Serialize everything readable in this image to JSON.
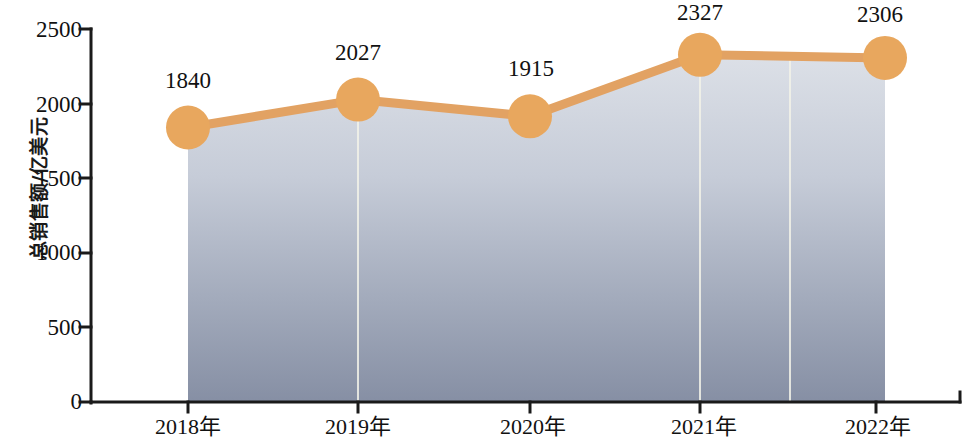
{
  "chart_data": {
    "type": "area",
    "title": "",
    "subtitle": "",
    "xlabel": "",
    "ylabel": "总销售额/亿美元",
    "categories": [
      "2018年",
      "2019年",
      "2020年",
      "2021年",
      "2022年"
    ],
    "values": [
      1840,
      2027,
      1915,
      2327,
      2306
    ],
    "data_labels": [
      "1840",
      "2027",
      "1915",
      "2327",
      "2306"
    ],
    "yticks": [
      "0",
      "500",
      "1000",
      "1500",
      "2000",
      "2500"
    ],
    "ytick_values": [
      0,
      500,
      1000,
      1500,
      2000,
      2500
    ],
    "ylim": [
      0,
      2500
    ],
    "grid": false,
    "legend": "none",
    "series": [
      {
        "name": "总销售额",
        "values": [
          1840,
          2027,
          1915,
          2327,
          2306
        ]
      }
    ],
    "colors": {
      "marker": "#E8A75E",
      "line": "#E2A263",
      "area_top": "#D9DDE5",
      "area_bottom": "#8892A6",
      "axis": "#1a1a1a",
      "text": "#111111",
      "gridline": "#F2F2E8"
    }
  },
  "axis": {
    "y_title": "总销售额/亿美元",
    "y_ticks": [
      "0",
      "500",
      "1000",
      "1500",
      "2000",
      "2500"
    ],
    "x_ticks": [
      "2018年",
      "2019年",
      "2020年",
      "2021年",
      "2022年"
    ]
  },
  "labels": {
    "p0": "1840",
    "p1": "2027",
    "p2": "1915",
    "p3": "2327",
    "p4": "2306"
  }
}
